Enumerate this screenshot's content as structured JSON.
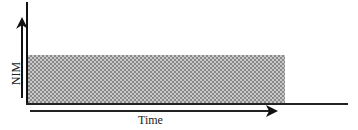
{
  "figure": {
    "y_axis_label": "NIM",
    "x_axis_label": "Time",
    "shaded_region": "constant NIM band",
    "colors": {
      "axis": "#111111",
      "shade_light": "#c8c8c8",
      "shade_dark": "#8a8a8a"
    }
  }
}
